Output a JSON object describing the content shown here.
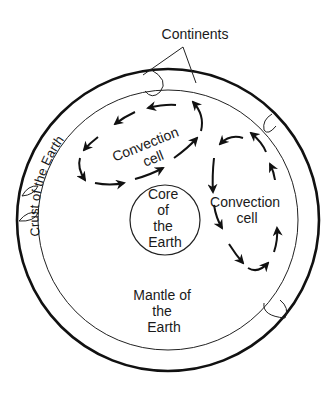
{
  "diagram": {
    "labels": {
      "continents": "Continents",
      "crust": "Crust of the Earth",
      "convection_cell_1_line1": "Convection",
      "convection_cell_1_line2": "cell",
      "convection_cell_2_line1": "Convection",
      "convection_cell_2_line2": "cell",
      "core_line1": "Core",
      "core_line2": "of",
      "core_line3": "the",
      "core_line4": "Earth",
      "mantle_line1": "Mantle of",
      "mantle_line2": "the",
      "mantle_line3": "Earth"
    },
    "colors": {
      "stroke": "#111111",
      "background": "#ffffff"
    }
  }
}
